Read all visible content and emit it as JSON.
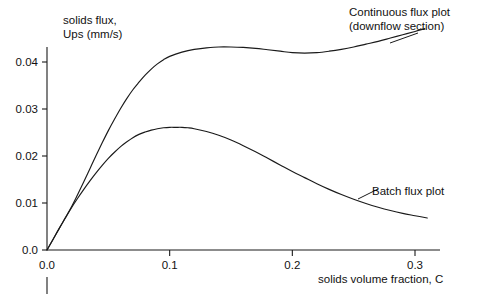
{
  "chart_data": {
    "type": "line",
    "title": "",
    "xlabel": "solids volume fraction, C",
    "ylabel": "solids flux, Ups (mm/s)",
    "ylabel_line1": "solids flux,",
    "ylabel_line2": "Ups (mm/s)",
    "xlim": [
      0.0,
      0.33
    ],
    "ylim": [
      0.0,
      0.0432
    ],
    "grid": false,
    "legend_position": "inline-annotations",
    "xticks": [
      0.0,
      0.1,
      0.2,
      0.3
    ],
    "xticklabels": [
      "0.0",
      "0.1",
      "0.2",
      "0.3"
    ],
    "yticks": [
      0.0,
      0.01,
      0.02,
      0.03,
      0.04
    ],
    "yticklabels": [
      "0.0",
      "0.01",
      "0.02",
      "0.03",
      "0.04"
    ],
    "annotations": [
      {
        "name": "continuous-flux-label",
        "line1": "Continuous flux plot",
        "line2": "(downflow section)",
        "x": 0.25,
        "y": 0.0455
      },
      {
        "name": "batch-flux-label",
        "line1": "Batch flux plot",
        "line2": "",
        "x": 0.265,
        "y": 0.0135
      }
    ],
    "series": [
      {
        "name": "Continuous flux plot (downflow section)",
        "color": "#1a1a1a",
        "points": [
          [
            0.0,
            0.0
          ],
          [
            0.005,
            0.0023
          ],
          [
            0.01,
            0.0046
          ],
          [
            0.015,
            0.0069
          ],
          [
            0.02,
            0.0092
          ],
          [
            0.025,
            0.0118
          ],
          [
            0.03,
            0.0145
          ],
          [
            0.035,
            0.0173
          ],
          [
            0.04,
            0.0201
          ],
          [
            0.045,
            0.0228
          ],
          [
            0.05,
            0.0254
          ],
          [
            0.055,
            0.0278
          ],
          [
            0.06,
            0.0301
          ],
          [
            0.065,
            0.0322
          ],
          [
            0.07,
            0.0341
          ],
          [
            0.075,
            0.0357
          ],
          [
            0.08,
            0.0372
          ],
          [
            0.085,
            0.0385
          ],
          [
            0.09,
            0.0396
          ],
          [
            0.095,
            0.0405
          ],
          [
            0.1,
            0.0412
          ],
          [
            0.11,
            0.0421
          ],
          [
            0.12,
            0.0427
          ],
          [
            0.13,
            0.043
          ],
          [
            0.14,
            0.0432
          ],
          [
            0.15,
            0.0432
          ],
          [
            0.16,
            0.0431
          ],
          [
            0.17,
            0.0429
          ],
          [
            0.18,
            0.0426
          ],
          [
            0.19,
            0.0423
          ],
          [
            0.2,
            0.042
          ],
          [
            0.21,
            0.0419
          ],
          [
            0.22,
            0.042
          ],
          [
            0.23,
            0.0423
          ],
          [
            0.24,
            0.0427
          ],
          [
            0.25,
            0.0432
          ],
          [
            0.26,
            0.0438
          ],
          [
            0.27,
            0.0444
          ],
          [
            0.28,
            0.0451
          ],
          [
            0.29,
            0.0458
          ],
          [
            0.3,
            0.0465
          ],
          [
            0.308,
            0.0471
          ]
        ]
      },
      {
        "name": "Batch flux plot",
        "color": "#1a1a1a",
        "points": [
          [
            0.0,
            0.0
          ],
          [
            0.005,
            0.0023
          ],
          [
            0.01,
            0.0046
          ],
          [
            0.015,
            0.0068
          ],
          [
            0.02,
            0.009
          ],
          [
            0.025,
            0.011
          ],
          [
            0.03,
            0.0129
          ],
          [
            0.035,
            0.0147
          ],
          [
            0.04,
            0.0164
          ],
          [
            0.045,
            0.018
          ],
          [
            0.05,
            0.0195
          ],
          [
            0.055,
            0.0208
          ],
          [
            0.06,
            0.022
          ],
          [
            0.065,
            0.023
          ],
          [
            0.07,
            0.0239
          ],
          [
            0.075,
            0.0246
          ],
          [
            0.08,
            0.0251
          ],
          [
            0.085,
            0.0255
          ],
          [
            0.09,
            0.0258
          ],
          [
            0.095,
            0.026
          ],
          [
            0.1,
            0.0261
          ],
          [
            0.105,
            0.0261
          ],
          [
            0.11,
            0.0261
          ],
          [
            0.115,
            0.026
          ],
          [
            0.12,
            0.0258
          ],
          [
            0.13,
            0.0252
          ],
          [
            0.14,
            0.0244
          ],
          [
            0.15,
            0.0234
          ],
          [
            0.16,
            0.0222
          ],
          [
            0.17,
            0.0209
          ],
          [
            0.18,
            0.0195
          ],
          [
            0.19,
            0.0181
          ],
          [
            0.2,
            0.0167
          ],
          [
            0.21,
            0.0154
          ],
          [
            0.22,
            0.0141
          ],
          [
            0.23,
            0.0129
          ],
          [
            0.24,
            0.0118
          ],
          [
            0.25,
            0.0108
          ],
          [
            0.26,
            0.0099
          ],
          [
            0.27,
            0.0091
          ],
          [
            0.28,
            0.0084
          ],
          [
            0.29,
            0.0078
          ],
          [
            0.3,
            0.0073
          ],
          [
            0.31,
            0.0068
          ]
        ]
      }
    ],
    "colors": {
      "axis": "#1a1a1a",
      "curve": "#1a1a1a",
      "background": "#ffffff",
      "text": "#111111"
    }
  }
}
